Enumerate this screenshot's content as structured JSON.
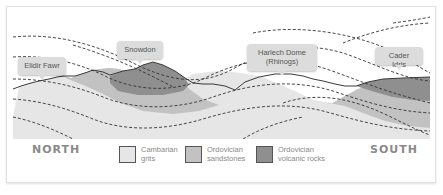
{
  "diagram": {
    "colors": {
      "cambrian_grits": "#e6e6e6",
      "ordovician_sandstones": "#c2c2c2",
      "ordovician_volcanic": "#8f8f8f",
      "surface_line": "#3a3a3a",
      "dashed_line": "#333333",
      "callout_bg": "#dcdcdc"
    },
    "callouts": [
      {
        "label": "Elidir Fawr"
      },
      {
        "label": "Snowdon"
      },
      {
        "label": "Harlech Dome\n(Rhinogs)",
        "line1": "Harlech Dome",
        "line2": "(Rhinogs)"
      },
      {
        "label": "Cader Idris"
      }
    ],
    "compass": {
      "north": "NORTH",
      "south": "SOUTH"
    },
    "legend": [
      {
        "line1": "Cambarian",
        "line2": "grits",
        "color": "#e6e6e6"
      },
      {
        "line1": "Ordovician",
        "line2": "sandstones",
        "color": "#c2c2c2"
      },
      {
        "line1": "Ordovician",
        "line2": "volcanic rocks",
        "color": "#8f8f8f"
      }
    ]
  }
}
